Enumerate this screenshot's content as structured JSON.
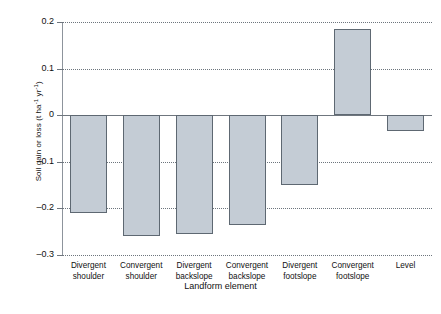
{
  "chart_data": {
    "type": "bar",
    "title": "",
    "xlabel": "Landform element",
    "ylabel": "Soil gain or loss (t ha⁻¹ yr⁻¹)",
    "ylabel_parts": {
      "main": "Soil gain or loss (t ha",
      "sup1": "-1",
      "mid": " yr",
      "sup2": "-1",
      "close": ")"
    },
    "categories": [
      "Divergent shoulder",
      "Convergent shoulder",
      "Divergent backslope",
      "Convergent backslope",
      "Divergent footslope",
      "Convergent footslope",
      "Level"
    ],
    "category_lines": [
      [
        "Divergent",
        "shoulder"
      ],
      [
        "Convergent",
        "shoulder"
      ],
      [
        "Divergent",
        "backslope"
      ],
      [
        "Convergent",
        "backslope"
      ],
      [
        "Divergent",
        "footslope"
      ],
      [
        "Convergent",
        "footslope"
      ],
      [
        "Level",
        ""
      ]
    ],
    "values": [
      -0.21,
      -0.26,
      -0.255,
      -0.235,
      -0.15,
      0.185,
      -0.035
    ],
    "ylim": [
      -0.3,
      0.2
    ],
    "yticks": [
      0.2,
      0.1,
      0,
      -0.1,
      -0.2,
      -0.3
    ],
    "ytick_labels": [
      "0.2",
      "0.1",
      "0",
      "–0.1",
      "–0.2",
      "–0.3"
    ],
    "grid": "horizontal-dotted",
    "legend": "none",
    "bar_fill": "#c4ccd5",
    "bar_edge": "#5e6872",
    "axis_color": "#6f767e",
    "background": "#ffffff"
  }
}
